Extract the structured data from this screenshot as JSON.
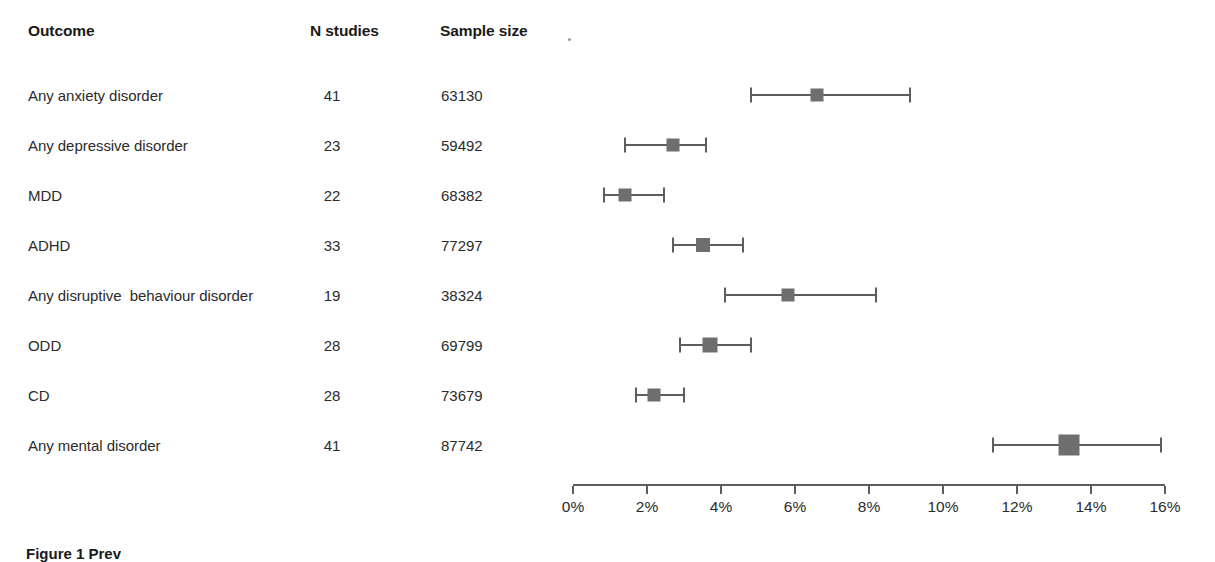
{
  "figure": {
    "caption": "Figure 1 Prev"
  },
  "table": {
    "headers": {
      "outcome": "Outcome",
      "n_studies": "N studies",
      "sample_size": "Sample size"
    }
  },
  "axis": {
    "tick_labels": [
      "0%",
      "2%",
      "4%",
      "6%",
      "8%",
      "10%",
      "12%",
      "14%",
      "16%"
    ]
  },
  "style": {
    "marker_color": "#6e6e6e",
    "line_color": "#5d5d5d",
    "text_color": "#2b2b2b",
    "background": "#ffffff"
  },
  "chart_data": {
    "type": "scatter",
    "title": "",
    "xlabel": "",
    "ylabel": "",
    "xlim": [
      0,
      16
    ],
    "x_tick_values": [
      0,
      2,
      4,
      6,
      8,
      10,
      12,
      14,
      16
    ],
    "x_tick_labels": [
      "0%",
      "2%",
      "4%",
      "6%",
      "8%",
      "10%",
      "12%",
      "14%",
      "16%"
    ],
    "x_unit": "%",
    "grid": false,
    "legend": false,
    "categories": [
      "Any anxiety disorder",
      "Any depressive disorder",
      "MDD",
      "ADHD",
      "Any disruptive  behaviour disorder",
      "ODD",
      "CD",
      "Any mental disorder"
    ],
    "rows": [
      {
        "outcome": "Any anxiety disorder",
        "n_studies": "41",
        "sample_size": "63130",
        "estimate": 6.6,
        "ci_low": 4.8,
        "ci_high": 9.1,
        "marker_size": 13
      },
      {
        "outcome": "Any depressive disorder",
        "n_studies": "23",
        "sample_size": "59492",
        "estimate": 2.7,
        "ci_low": 1.4,
        "ci_high": 3.6,
        "marker_size": 13
      },
      {
        "outcome": "MDD",
        "n_studies": "22",
        "sample_size": "68382",
        "estimate": 1.4,
        "ci_low": 0.85,
        "ci_high": 2.45,
        "marker_size": 13
      },
      {
        "outcome": "ADHD",
        "n_studies": "33",
        "sample_size": "77297",
        "estimate": 3.5,
        "ci_low": 2.7,
        "ci_high": 4.6,
        "marker_size": 14
      },
      {
        "outcome": "Any disruptive  behaviour disorder",
        "n_studies": "19",
        "sample_size": "38324",
        "estimate": 5.8,
        "ci_low": 4.1,
        "ci_high": 8.2,
        "marker_size": 13
      },
      {
        "outcome": "ODD",
        "n_studies": "28",
        "sample_size": "69799",
        "estimate": 3.7,
        "ci_low": 2.9,
        "ci_high": 4.8,
        "marker_size": 15
      },
      {
        "outcome": "CD",
        "n_studies": "28",
        "sample_size": "73679",
        "estimate": 2.2,
        "ci_low": 1.7,
        "ci_high": 3.0,
        "marker_size": 13
      },
      {
        "outcome": "Any mental disorder",
        "n_studies": "41",
        "sample_size": "87742",
        "estimate": 13.4,
        "ci_low": 11.35,
        "ci_high": 15.9,
        "marker_size": 21
      }
    ]
  }
}
